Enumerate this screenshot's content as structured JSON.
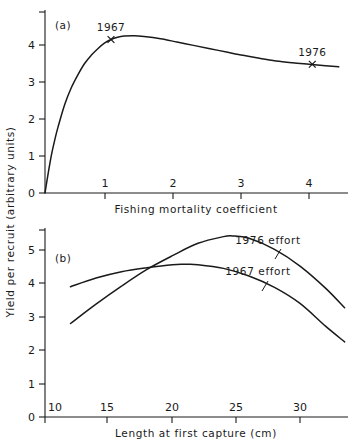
{
  "figure": {
    "background_color": "#ffffff",
    "ink_color": "#1a1a1a",
    "shared_ylabel": "Yield per recruit  (arbitrary units)"
  },
  "panel_a": {
    "tag": "(a)",
    "xlabel": "Fishing mortality coefficient",
    "xticks": [
      "1",
      "2",
      "3",
      "4"
    ],
    "yticks": [
      "0",
      "1",
      "2",
      "3",
      "4"
    ],
    "annotations": [
      {
        "label": "1967",
        "x": 1.0,
        "y": 4.15
      },
      {
        "label": "1976",
        "x": 4.05,
        "y": 3.48
      }
    ]
  },
  "panel_b": {
    "tag": "(b)",
    "xlabel": "Length at first capture  (cm)",
    "xticks": [
      "10",
      "15",
      "20",
      "25",
      "30"
    ],
    "yticks": [
      "0",
      "1",
      "2",
      "3",
      "4",
      "5"
    ],
    "series_labels": [
      {
        "label": "1976 effort"
      },
      {
        "label": "1967 effort"
      }
    ]
  },
  "chart_data": [
    {
      "type": "line",
      "panel": "(a)",
      "title": "",
      "xlabel": "Fishing mortality coefficient",
      "ylabel": "Yield per recruit (arbitrary units)",
      "xlim": [
        0,
        4.6
      ],
      "ylim": [
        0,
        4.7
      ],
      "xticks": [
        1,
        2,
        3,
        4
      ],
      "yticks": [
        0,
        1,
        2,
        3,
        4
      ],
      "grid": false,
      "legend": "none",
      "series": [
        {
          "name": "yield per recruit",
          "x": [
            0.0,
            0.05,
            0.1,
            0.15,
            0.2,
            0.3,
            0.4,
            0.5,
            0.6,
            0.7,
            0.8,
            0.9,
            1.0,
            1.1,
            1.2,
            1.35,
            1.5,
            1.75,
            2.0,
            2.25,
            2.5,
            2.75,
            3.0,
            3.25,
            3.5,
            3.75,
            4.0,
            4.25,
            4.45
          ],
          "y": [
            0.0,
            0.55,
            1.05,
            1.45,
            1.8,
            2.4,
            2.85,
            3.2,
            3.5,
            3.72,
            3.9,
            4.05,
            4.15,
            4.21,
            4.24,
            4.25,
            4.23,
            4.17,
            4.08,
            3.99,
            3.9,
            3.81,
            3.72,
            3.64,
            3.57,
            3.52,
            3.48,
            3.44,
            3.41
          ]
        }
      ],
      "annotations": [
        {
          "text": "1967",
          "x": 1.0,
          "y": 4.15,
          "marker": "x"
        },
        {
          "text": "1976",
          "x": 4.05,
          "y": 3.48,
          "marker": "x"
        }
      ]
    },
    {
      "type": "line",
      "panel": "(b)",
      "title": "",
      "xlabel": "Length at first capture (cm)",
      "ylabel": "Yield per recruit (arbitrary units)",
      "xlim": [
        10,
        33.8
      ],
      "ylim": [
        0,
        5.8
      ],
      "xticks": [
        10,
        15,
        20,
        25,
        30
      ],
      "yticks": [
        0,
        1,
        2,
        3,
        4,
        5
      ],
      "grid": false,
      "legend": "inline-labels",
      "series": [
        {
          "name": "1967 effort",
          "x": [
            12.0,
            14.0,
            16.0,
            18.0,
            20.0,
            21.0,
            22.0,
            24.0,
            26.0,
            28.0,
            30.0,
            32.0,
            33.5
          ],
          "y": [
            3.9,
            4.16,
            4.35,
            4.47,
            4.56,
            4.57,
            4.56,
            4.45,
            4.22,
            3.88,
            3.4,
            2.72,
            2.25
          ]
        },
        {
          "name": "1976 effort",
          "x": [
            12.0,
            14.0,
            16.0,
            18.0,
            20.0,
            22.0,
            24.0,
            24.7,
            26.0,
            28.0,
            30.0,
            32.0,
            33.5
          ],
          "y": [
            2.8,
            3.38,
            3.92,
            4.42,
            4.83,
            5.2,
            5.4,
            5.42,
            5.35,
            5.02,
            4.52,
            3.86,
            3.27
          ]
        }
      ],
      "annotations": [
        {
          "text": "1976 effort",
          "points_to_series": "1976 effort"
        },
        {
          "text": "1967 effort",
          "points_to_series": "1967 effort"
        }
      ]
    }
  ]
}
